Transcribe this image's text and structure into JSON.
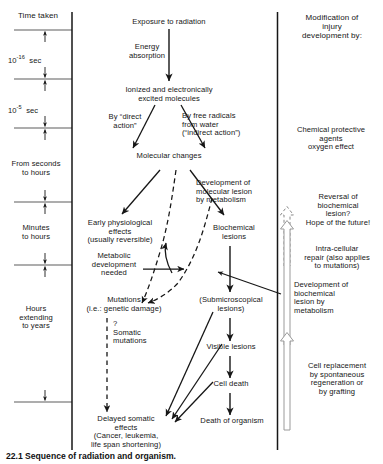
{
  "figure": {
    "background_color": "#ffffff",
    "ink_color": "#161616"
  },
  "columns": {
    "left_header": "Time taken",
    "right_header": "Modification of\ninjury\ndevelopment by:"
  },
  "time_axis": {
    "name": "Time taken",
    "intervals": [
      {
        "label": "10",
        "exponent": "-16",
        "unit": "sec"
      },
      {
        "label": "10",
        "exponent": "-5",
        "unit": "sec"
      },
      {
        "label": "From seconds\nto hours",
        "exponent": "",
        "unit": ""
      },
      {
        "label": "Minutes\nto hours",
        "exponent": "",
        "unit": ""
      },
      {
        "label": "Hours\nextending\nto years",
        "exponent": "",
        "unit": ""
      }
    ]
  },
  "nodes": {
    "exposure": "Exposure to radiation",
    "energy_absorption": "Energy\nabsorption",
    "ionized": "Ionized and electronically\nexcited molecules",
    "direct_action": "By “direct\naction”",
    "indirect_action": "By free radicals\nfrom water\n(“indirect action”)",
    "molecular_changes": "Molecular changes",
    "development_molecular_lesion": "Development of\nmolecular lesion\nby metabolism",
    "early_physiological": "Early physiological\neffects\n(usually reversible)",
    "metabolic_development": "Metabolic\ndevelopment\nneeded",
    "biochemical_lesions": "Biochemical\nlesions",
    "mutations": "Mutations\n(i.e.: genetic damage)",
    "somatic_mutations": "?\nSomatic\nmutations",
    "submicroscopical": "(Submicroscopical\nlesions)",
    "visible_lesions": "Visible lesions",
    "cell_death": "Cell death",
    "death_of_organism": "Death of organism",
    "delayed_somatic": "Delayed somatic\neffects\n(Cancer, leukemia,\nlife span shortening)"
  },
  "modifiers": {
    "chemical_protective": "Chemical protective\nagents\noxygen effect",
    "reversal_biochemical": "Reversal of\nbiochemical\nlesion?\nHope of the future!",
    "intra_cellular_repair": "Intra-cellular\nrepair (also applies\nto mutations)",
    "development_biochemical_lesion": "Development of\nbiochemical\nlesion by\nmetabolism",
    "cell_replacement": "Cell replacement\nby spontaneous\nregeneration or\nby grafting"
  },
  "caption": "22.1  Sequence of radiation and organism."
}
